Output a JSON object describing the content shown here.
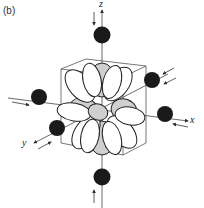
{
  "figure": {
    "panel_label": "(b)",
    "axes": {
      "x": "x",
      "y": "y",
      "z": "z"
    },
    "ligands": [
      "+z",
      "-z",
      "+x",
      "-x",
      "+y",
      "-y"
    ],
    "colors": {
      "ligand": "#1a1a1a",
      "lobe_shaded": "#cfcfcf",
      "line": "#333333",
      "background": "#ffffff"
    }
  }
}
